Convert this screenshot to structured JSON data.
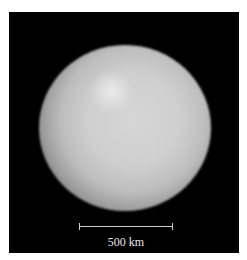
{
  "image": {
    "subject": "planetary-body",
    "background_color": "#000000",
    "border_color": "#ffffff"
  },
  "scale_bar": {
    "label": "500 km",
    "color": "#cfcfcf"
  }
}
